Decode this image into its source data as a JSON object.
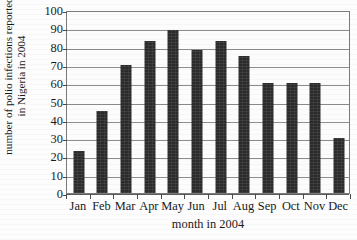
{
  "chart_data": {
    "type": "bar",
    "title": "",
    "xlabel": "month in 2004",
    "ylabel_lines": [
      "number of polio infections reported",
      "in Nigeria in 2004"
    ],
    "ylabel": "number of polio infections reported in Nigeria in 2004",
    "categories": [
      "Jan",
      "Feb",
      "Mar",
      "Apr",
      "May",
      "Jun",
      "Jul",
      "Aug",
      "Sep",
      "Oct",
      "Nov",
      "Dec"
    ],
    "values": [
      23,
      45,
      70,
      83,
      89,
      78,
      83,
      75,
      60,
      60,
      60,
      30
    ],
    "ylim": [
      0,
      100
    ],
    "ytick_labels": [
      "0",
      "10",
      "20",
      "30",
      "40",
      "50",
      "60",
      "70",
      "80",
      "90",
      "100"
    ],
    "ytick_values": [
      0,
      10,
      20,
      30,
      40,
      50,
      60,
      70,
      80,
      90,
      100
    ],
    "grid": "horizontal",
    "legend": "none",
    "bar_color": "#2b2b2b",
    "grid_color": "#8d8d8d",
    "frame_color": "#7b7b7b",
    "background_color": "#fdfdfd"
  }
}
